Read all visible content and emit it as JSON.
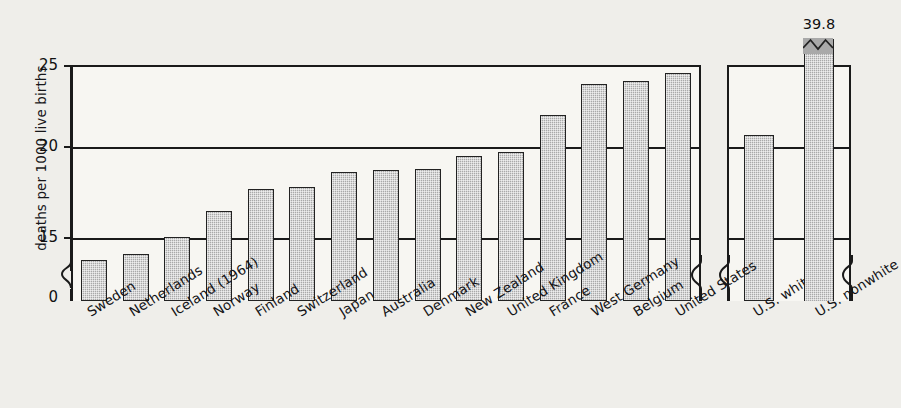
{
  "chart_data": {
    "type": "bar",
    "title": "",
    "xlabel": "",
    "ylabel": "deaths per 1000 live births",
    "ylim": [
      0,
      25
    ],
    "y_ticks": [
      0,
      15,
      20,
      25
    ],
    "y_tick_labels": [
      "0",
      "15",
      "20",
      "25"
    ],
    "axis_break": true,
    "axis_break_note": "y-axis broken between 0 and 15",
    "grid": true,
    "legend": "none",
    "panels": [
      {
        "name": "countries",
        "categories": [
          "Sweden",
          "Netherlands",
          "Iceland (1964)",
          "Norway",
          "Finland",
          "Switzerland",
          "Japan",
          "Australia",
          "Denmark",
          "New Zealand",
          "United Kingdom",
          "France",
          "West Germany",
          "Belgium",
          "United States"
        ],
        "values": [
          12.9,
          13.4,
          14.9,
          16.4,
          17.6,
          17.7,
          18.5,
          18.6,
          18.7,
          19.4,
          19.6,
          21.9,
          23.8,
          24.0,
          24.5
        ],
        "data_labels": [
          "",
          "",
          "",
          "",
          "",
          "",
          "",
          "",
          "",
          "",
          "",
          "",
          "",
          "",
          ""
        ]
      },
      {
        "name": "united-states-breakdown",
        "categories": [
          "U.S. white",
          "U.S. nonwhite"
        ],
        "values": [
          20.6,
          39.8
        ],
        "data_labels": [
          "",
          "39.8"
        ],
        "clipped": [
          false,
          true
        ]
      }
    ]
  },
  "axis": {
    "y_label": "deaths per 1000 live births",
    "ticks": [
      {
        "label": "25"
      },
      {
        "label": "20"
      },
      {
        "label": "15"
      },
      {
        "label": "0"
      }
    ]
  },
  "colors": {
    "background": "#efeeea",
    "panel_fill": "#f7f6f2",
    "bar_fill": "#a9a9a9",
    "bar_stroke": "#222222",
    "axis": "#1a1a1a",
    "text": "#131316"
  }
}
